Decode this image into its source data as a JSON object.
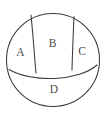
{
  "diagram": {
    "type": "venn-like-partition",
    "shape": "circle",
    "stroke_color": "#3a3a3a",
    "fill_color": "#ffffff",
    "label_color": "#4a4a4a",
    "circle": {
      "center_x": 53,
      "center_y": 60,
      "radius": 46.5
    },
    "regions": [
      {
        "id": "A",
        "label": "A",
        "position": "left",
        "label_x": 20.5,
        "label_y": 53
      },
      {
        "id": "B",
        "label": "B",
        "position": "center-top",
        "label_x": 52.5,
        "label_y": 44
      },
      {
        "id": "C",
        "label": "C",
        "position": "right",
        "label_x": 82,
        "label_y": 52
      },
      {
        "id": "D",
        "label": "D",
        "position": "bottom",
        "label_x": 54,
        "label_y": 90
      }
    ],
    "dividers": [
      {
        "id": "left-divider",
        "from_x": 31,
        "from_y": 15,
        "to_x": 36,
        "to_y": 73
      },
      {
        "id": "right-divider",
        "from_x": 74,
        "from_y": 16.5,
        "to_x": 72,
        "to_y": 70
      },
      {
        "id": "bottom-divider",
        "from_x": 9,
        "from_y": 69.5,
        "to_x": 97,
        "to_y": 65
      }
    ]
  }
}
